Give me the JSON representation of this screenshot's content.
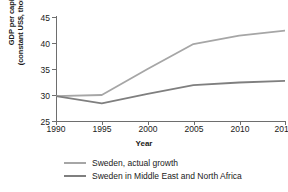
{
  "chart_data": {
    "type": "line",
    "title": "",
    "xlabel": "Year",
    "ylabel": "GDP per capita (constant US$, thousands)",
    "ylabel_line1": "GDP per capita",
    "ylabel_line2": "(constant US$, thousands)",
    "x": [
      1990,
      1995,
      2000,
      2005,
      2010,
      2015
    ],
    "xticklabels": [
      "1990",
      "1995",
      "2000",
      "2005",
      "2010",
      "2015"
    ],
    "yticks": [
      25,
      30,
      35,
      40,
      45
    ],
    "yticklabels": [
      "25",
      "30",
      "35",
      "40",
      "45"
    ],
    "xlim": [
      1990,
      2015
    ],
    "ylim": [
      25,
      45
    ],
    "grid": false,
    "legend_position": "bottom",
    "series": [
      {
        "name": "Sweden, actual growth",
        "color": "#a6a6a6",
        "values": [
          29.8,
          30.0,
          35.0,
          39.8,
          41.4,
          42.4
        ]
      },
      {
        "name": "Sweden in Middle East and North Africa",
        "color": "#7f7f7f",
        "values": [
          29.8,
          28.4,
          30.2,
          31.9,
          32.4,
          32.7
        ]
      }
    ]
  },
  "axis": {
    "color": "#6e6e6e"
  }
}
